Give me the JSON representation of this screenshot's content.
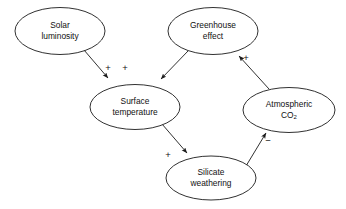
{
  "diagram": {
    "canvas": {
      "width": 346,
      "height": 209,
      "background": "#ffffff"
    },
    "style": {
      "stroke_color": "#1a1a1a",
      "text_color": "#111111",
      "node_fill": "#ffffff",
      "stroke_width": 0.9
    },
    "nodes": [
      {
        "id": "solar-luminosity",
        "lines": [
          "Solar",
          "luminosity"
        ],
        "cx": 60,
        "cy": 31,
        "rx": 45,
        "ry": 23.5
      },
      {
        "id": "greenhouse-effect",
        "lines": [
          "Greenhouse",
          "effect"
        ],
        "cx": 213,
        "cy": 31,
        "rx": 45,
        "ry": 23.5
      },
      {
        "id": "surface-temperature",
        "lines": [
          "Surface",
          "temperature"
        ],
        "cx": 135,
        "cy": 107,
        "rx": 45,
        "ry": 22.5
      },
      {
        "id": "atmospheric-co2",
        "lines": [
          "Atmospheric",
          "CO2"
        ],
        "subscript_line": 1,
        "subscript_text": "2",
        "base_text": "CO",
        "cx": 289,
        "cy": 110,
        "rx": 46,
        "ry": 22.5
      },
      {
        "id": "silicate-weathering",
        "lines": [
          "Silicate",
          "weathering"
        ],
        "cx": 211,
        "cy": 178,
        "rx": 45,
        "ry": 22
      }
    ],
    "edges": [
      {
        "id": "solar-to-surface",
        "from": "solar-luminosity",
        "to": "surface-temperature",
        "sign": "+",
        "x1": 84,
        "y1": 50,
        "x2": 108,
        "y2": 78,
        "label_x": 108,
        "label_y": 68
      },
      {
        "id": "greenhouse-to-surface",
        "from": "greenhouse-effect",
        "to": "surface-temperature",
        "sign": "+",
        "x1": 188,
        "y1": 51,
        "x2": 161,
        "y2": 79,
        "label_x": 125,
        "label_y": 68
      },
      {
        "id": "co2-to-greenhouse",
        "from": "atmospheric-co2",
        "to": "greenhouse-effect",
        "sign": "+",
        "x1": 269,
        "y1": 89,
        "x2": 239,
        "y2": 56,
        "label_x": 246,
        "label_y": 58
      },
      {
        "id": "surface-to-silicate",
        "from": "surface-temperature",
        "to": "silicate-weathering",
        "sign": "+",
        "x1": 162,
        "y1": 124,
        "x2": 187,
        "y2": 153,
        "label_x": 168,
        "label_y": 155
      },
      {
        "id": "silicate-to-co2",
        "from": "silicate-weathering",
        "to": "atmospheric-co2",
        "sign": "−",
        "x1": 246,
        "y1": 166,
        "x2": 266,
        "y2": 133,
        "label_x": 268,
        "label_y": 141
      }
    ]
  }
}
